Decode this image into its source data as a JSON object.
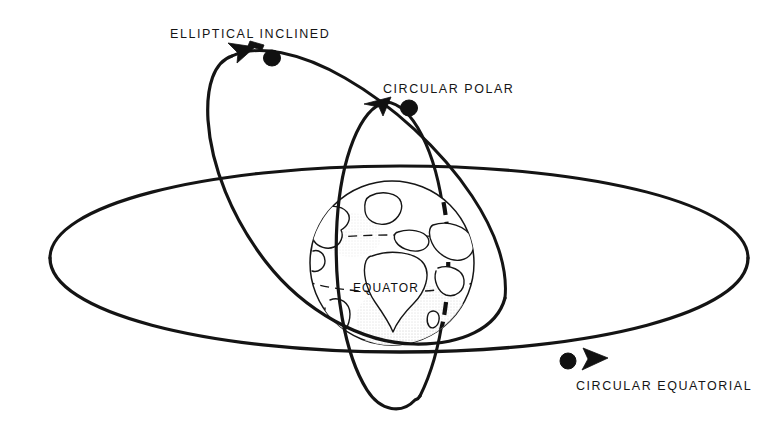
{
  "diagram": {
    "background_color": "#ffffff",
    "ink_color": "#141414",
    "style": "scanned line drawing"
  },
  "labels": {
    "elliptical_inclined": "ELLIPTICAL INCLINED",
    "circular_polar": "CIRCULAR POLAR",
    "circular_equatorial": "CIRCULAR EQUATORIAL",
    "equator": "EQUATOR"
  },
  "orbits": [
    {
      "id": "elliptical-inclined",
      "label": "ELLIPTICAL INCLINED",
      "shape": "ellipse",
      "inclination": "inclined",
      "marker_dot": {
        "x": 272,
        "y": 58
      },
      "marker_arrow": {
        "x": 243,
        "y": 50,
        "direction": "up-left"
      },
      "label_position": {
        "x": 170,
        "y": 38
      }
    },
    {
      "id": "circular-polar",
      "label": "CIRCULAR POLAR",
      "shape": "circle",
      "inclination": "polar",
      "marker_dot": {
        "x": 409,
        "y": 108
      },
      "marker_arrow": {
        "x": 380,
        "y": 104,
        "direction": "left"
      },
      "label_position": {
        "x": 383,
        "y": 93
      }
    },
    {
      "id": "circular-equatorial",
      "label": "CIRCULAR EQUATORIAL",
      "shape": "circle",
      "inclination": "equatorial",
      "marker_dot": {
        "x": 568,
        "y": 361
      },
      "marker_arrow": {
        "x": 596,
        "y": 357,
        "direction": "right"
      },
      "label_position": {
        "x": 576,
        "y": 390
      }
    }
  ],
  "earth": {
    "label": "EQUATOR",
    "center": {
      "x": 392,
      "y": 263
    },
    "radius": 82,
    "features": [
      "equator-dashed-line",
      "latitude-line",
      "prime-meridian-dashed",
      "continent-north-america",
      "continent-greenland",
      "continent-europe",
      "continent-africa",
      "continent-asia"
    ],
    "equator_label_position": {
      "x": 353,
      "y": 292
    }
  }
}
